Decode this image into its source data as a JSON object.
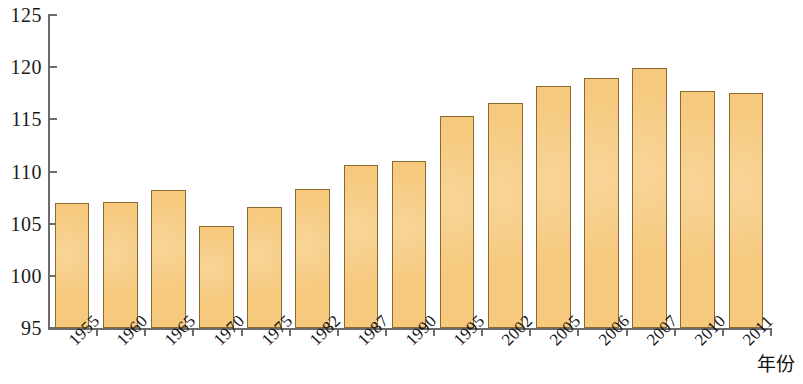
{
  "chart_data": {
    "type": "bar",
    "title": "",
    "subtitle": "",
    "xlabel": "年份",
    "ylabel": "",
    "categories": [
      "1955",
      "1960",
      "1965",
      "1970",
      "1975",
      "1982",
      "1987",
      "1990",
      "1995",
      "2002",
      "2005",
      "2006",
      "2007",
      "2010",
      "2011"
    ],
    "values": [
      107.0,
      107.1,
      108.2,
      104.8,
      106.6,
      108.3,
      110.6,
      111.0,
      115.3,
      116.6,
      118.2,
      119.0,
      119.9,
      117.7,
      117.5
    ],
    "ylim": [
      95,
      125
    ],
    "y_ticks": [
      95,
      100,
      105,
      110,
      115,
      120,
      125
    ],
    "y_tick_labels": [
      "95",
      "100",
      "105",
      "110",
      "115",
      "120",
      "125"
    ],
    "grid": false,
    "legend": null,
    "legend_position": "none",
    "bar_fill_color": "#f6c97c",
    "bar_border_color": "#8a6a33",
    "axis_color": "#6b6b6b",
    "background_color": "#ffffff",
    "annotations": []
  }
}
